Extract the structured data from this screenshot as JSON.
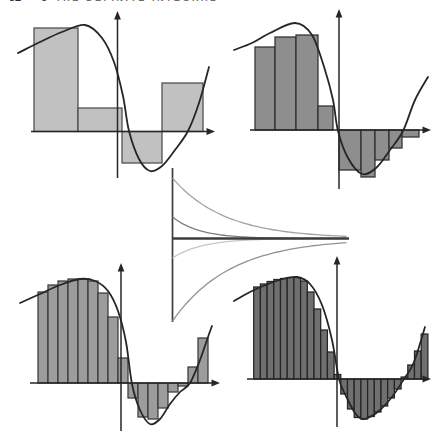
{
  "header": {
    "page_number": "32",
    "section_number": "3",
    "section_title": "THE DEFINITE INTEGRAL"
  },
  "figure": {
    "curve_color": "#262626",
    "axis_color": "#262626",
    "panels": [
      {
        "id": "riemann-panel-coarse",
        "rect_count": 4,
        "fill": "#c1c1c1",
        "stroke": "#4c4c4c",
        "axis": {
          "x_y": 131.5,
          "x_from": 31,
          "x_to": 208,
          "y_x": 117.5,
          "y_from": 15,
          "y_to": 178
        },
        "bars": [
          [
            34,
            78,
            28
          ],
          [
            78,
            122,
            108
          ],
          [
            122,
            162,
            163
          ],
          [
            162,
            203,
            83
          ]
        ],
        "curve": [
          [
            18,
            53
          ],
          [
            40,
            42
          ],
          [
            62,
            32
          ],
          [
            85,
            25
          ],
          [
            102,
            38
          ],
          [
            114,
            62
          ],
          [
            123,
            96
          ],
          [
            129,
            131
          ],
          [
            139,
            159
          ],
          [
            150,
            171
          ],
          [
            162,
            166
          ],
          [
            175,
            150
          ],
          [
            188,
            131
          ],
          [
            199,
            103
          ],
          [
            209,
            67
          ]
        ]
      },
      {
        "id": "riemann-panel-medium",
        "rect_count": 9,
        "fill": "#8e8e8e",
        "stroke": "#2f2f2f",
        "axis": {
          "x_y": 130,
          "x_from": 250,
          "x_to": 424,
          "y_x": 339,
          "y_from": 13,
          "y_to": 189
        },
        "bars": [
          [
            255,
            275,
            47
          ],
          [
            275,
            296,
            37
          ],
          [
            296,
            318,
            35
          ],
          [
            318,
            333,
            106
          ],
          [
            339,
            361,
            170
          ],
          [
            361,
            375,
            177
          ],
          [
            375,
            389,
            160
          ],
          [
            389,
            402,
            148
          ],
          [
            402,
            419,
            137
          ]
        ],
        "curve": [
          [
            234,
            50
          ],
          [
            252,
            43
          ],
          [
            270,
            33
          ],
          [
            295,
            23
          ],
          [
            312,
            35
          ],
          [
            325,
            70
          ],
          [
            333,
            100
          ],
          [
            338,
            131
          ],
          [
            348,
            158
          ],
          [
            362,
            174
          ],
          [
            376,
            168
          ],
          [
            390,
            150
          ],
          [
            403,
            131
          ],
          [
            415,
            100
          ],
          [
            428,
            77
          ]
        ]
      },
      {
        "id": "riemann-panel-fine",
        "rect_count": 17,
        "fill": "#9c9c9c",
        "stroke": "#3a3a3a",
        "axis": {
          "x_y": 383,
          "x_from": 30,
          "x_to": 213,
          "y_x": 121,
          "y_from": 267,
          "y_to": 431
        },
        "bars": [
          [
            38,
            48,
            292
          ],
          [
            48,
            58,
            285
          ],
          [
            58,
            68,
            281
          ],
          [
            68,
            78,
            279
          ],
          [
            78,
            88,
            279
          ],
          [
            88,
            98,
            281
          ],
          [
            98,
            108,
            293
          ],
          [
            108,
            118,
            317
          ],
          [
            118,
            128,
            358
          ],
          [
            128,
            138,
            398
          ],
          [
            138,
            148,
            417
          ],
          [
            148,
            158,
            419
          ],
          [
            158,
            168,
            408
          ],
          [
            168,
            178,
            392
          ],
          [
            178,
            188,
            386
          ],
          [
            188,
            198,
            367
          ],
          [
            198,
            208,
            338
          ]
        ],
        "curve": [
          [
            20,
            303
          ],
          [
            40,
            294
          ],
          [
            60,
            285
          ],
          [
            80,
            279
          ],
          [
            95,
            281
          ],
          [
            108,
            291
          ],
          [
            118,
            311
          ],
          [
            126,
            342
          ],
          [
            132,
            384
          ],
          [
            140,
            410
          ],
          [
            150,
            424
          ],
          [
            160,
            419
          ],
          [
            170,
            404
          ],
          [
            180,
            392
          ],
          [
            190,
            383
          ],
          [
            200,
            360
          ],
          [
            208,
            337
          ],
          [
            212,
            326
          ]
        ]
      },
      {
        "id": "riemann-panel-finest",
        "rect_count": 26,
        "fill": "#6f6f6f",
        "stroke": "#252525",
        "axis": {
          "x_y": 379,
          "x_from": 247,
          "x_to": 424,
          "y_x": 337,
          "y_from": 260,
          "y_to": 427
        },
        "bars": [
          [
            253.7,
            260.4,
            287
          ],
          [
            260.4,
            267.1,
            284
          ],
          [
            267.1,
            273.8,
            281.5
          ],
          [
            273.8,
            280.5,
            279.5
          ],
          [
            280.5,
            287.2,
            278.5
          ],
          [
            287.2,
            293.9,
            277.5
          ],
          [
            293.9,
            300.6,
            277.5
          ],
          [
            300.6,
            307.3,
            281
          ],
          [
            307.3,
            314,
            292
          ],
          [
            314,
            320.7,
            309
          ],
          [
            320.7,
            327.4,
            330
          ],
          [
            327.4,
            334.1,
            352
          ],
          [
            334.1,
            340.8,
            374.5
          ],
          [
            340.8,
            347.5,
            394
          ],
          [
            347.5,
            354.2,
            409
          ],
          [
            354.2,
            360.9,
            417.5
          ],
          [
            360.9,
            367.6,
            419
          ],
          [
            367.6,
            374.3,
            416.5
          ],
          [
            374.3,
            381,
            412
          ],
          [
            381,
            387.7,
            406
          ],
          [
            387.7,
            394.4,
            398
          ],
          [
            394.4,
            401.1,
            389
          ],
          [
            401.1,
            407.8,
            377
          ],
          [
            407.8,
            414.5,
            365
          ],
          [
            414.5,
            421.2,
            351
          ],
          [
            421.2,
            427.9,
            334
          ]
        ],
        "curve": [
          [
            234,
            301
          ],
          [
            250,
            292
          ],
          [
            268,
            284
          ],
          [
            283,
            279
          ],
          [
            297,
            277
          ],
          [
            310,
            284
          ],
          [
            322,
            305
          ],
          [
            332,
            340
          ],
          [
            339,
            379
          ],
          [
            346,
            396
          ],
          [
            355,
            413
          ],
          [
            362,
            419
          ],
          [
            370,
            417
          ],
          [
            380,
            410
          ],
          [
            392,
            397
          ],
          [
            404,
            379
          ],
          [
            414,
            362
          ],
          [
            425,
            327
          ]
        ]
      }
    ],
    "funnel": {
      "axis_x": 172.5,
      "axis_top": 168,
      "axis_bottom": 322,
      "axis_color": "#3c3c3c",
      "center_y": 238.5,
      "center_from": 172.5,
      "center_to": 349,
      "center_color": "#3c3c3c",
      "curves": [
        {
          "name": "upper-outer-envelope",
          "start_y": 178,
          "decay": 52,
          "color": "#a2a2a2"
        },
        {
          "name": "upper-inner-envelope",
          "start_y": 217,
          "decay": 27,
          "color": "#7b7b7b"
        },
        {
          "name": "lower-inner-envelope",
          "start_y": 258,
          "decay": 30,
          "color": "#c6c6c6"
        },
        {
          "name": "lower-outer-envelope",
          "start_y": 321,
          "decay": 58,
          "color": "#929292"
        }
      ]
    }
  }
}
